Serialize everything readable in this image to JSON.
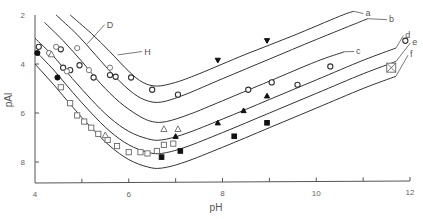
{
  "chart_data": {
    "type": "line",
    "title": "",
    "xlabel": "pH",
    "ylabel": "pAl",
    "xlim": [
      4,
      12
    ],
    "ylim": [
      2,
      8.85
    ],
    "y_inverted": true,
    "grid": false,
    "x_ticks": [
      4,
      5,
      6,
      7,
      8,
      9,
      10,
      11,
      12
    ],
    "x_tick_labels": [
      "4",
      "",
      "6",
      "",
      "8",
      "",
      "10",
      "",
      "12"
    ],
    "y_ticks": [
      2,
      4,
      6,
      8
    ],
    "y_tick_labels": [
      "2",
      "4",
      "6",
      "8"
    ],
    "series": [
      {
        "name": "a",
        "type": "curve",
        "points": [
          [
            4.75,
            2.0
          ],
          [
            5.2,
            2.75
          ],
          [
            5.6,
            3.5
          ],
          [
            6.0,
            4.3
          ],
          [
            6.3,
            4.75
          ],
          [
            6.6,
            4.9
          ],
          [
            7.0,
            4.75
          ],
          [
            7.5,
            4.4
          ],
          [
            8.5,
            3.6
          ],
          [
            9.5,
            2.85
          ],
          [
            10.5,
            2.05
          ],
          [
            10.8,
            1.85
          ]
        ]
      },
      {
        "name": "b",
        "type": "curve",
        "points": [
          [
            4.45,
            2.0
          ],
          [
            4.9,
            2.8
          ],
          [
            5.3,
            3.65
          ],
          [
            5.7,
            4.5
          ],
          [
            6.1,
            5.2
          ],
          [
            6.4,
            5.5
          ],
          [
            6.7,
            5.55
          ],
          [
            7.2,
            5.25
          ],
          [
            8.0,
            4.6
          ],
          [
            9.0,
            3.8
          ],
          [
            10.0,
            3.0
          ],
          [
            11.1,
            2.15
          ]
        ]
      },
      {
        "name": "c",
        "type": "curve",
        "points": [
          [
            4.2,
            2.3
          ],
          [
            4.6,
            3.05
          ],
          [
            5.0,
            3.9
          ],
          [
            5.4,
            4.8
          ],
          [
            5.8,
            5.55
          ],
          [
            6.2,
            6.1
          ],
          [
            6.5,
            6.35
          ],
          [
            6.8,
            6.35
          ],
          [
            7.3,
            6.05
          ],
          [
            8.0,
            5.5
          ],
          [
            9.0,
            4.7
          ],
          [
            10.0,
            3.9
          ],
          [
            10.6,
            3.5
          ]
        ]
      },
      {
        "name": "d",
        "type": "curve",
        "points": [
          [
            4.0,
            2.95
          ],
          [
            4.4,
            3.7
          ],
          [
            4.8,
            4.6
          ],
          [
            5.2,
            5.45
          ],
          [
            5.6,
            6.2
          ],
          [
            6.0,
            6.75
          ],
          [
            6.4,
            7.05
          ],
          [
            6.7,
            7.1
          ],
          [
            7.2,
            6.85
          ],
          [
            8.0,
            6.25
          ],
          [
            9.0,
            5.45
          ],
          [
            10.0,
            4.65
          ],
          [
            11.0,
            3.85
          ],
          [
            11.7,
            3.35
          ]
        ]
      },
      {
        "name": "e",
        "type": "curve",
        "points": [
          [
            4.0,
            3.45
          ],
          [
            4.4,
            4.25
          ],
          [
            4.8,
            5.15
          ],
          [
            5.2,
            6.0
          ],
          [
            5.6,
            6.75
          ],
          [
            6.0,
            7.3
          ],
          [
            6.4,
            7.6
          ],
          [
            6.7,
            7.65
          ],
          [
            7.2,
            7.4
          ],
          [
            8.0,
            6.8
          ],
          [
            9.0,
            6.0
          ],
          [
            10.0,
            5.2
          ],
          [
            11.0,
            4.4
          ],
          [
            11.7,
            3.9
          ]
        ]
      },
      {
        "name": "f",
        "type": "curve",
        "points": [
          [
            4.0,
            4.0
          ],
          [
            4.4,
            4.85
          ],
          [
            4.8,
            5.75
          ],
          [
            5.2,
            6.6
          ],
          [
            5.6,
            7.35
          ],
          [
            6.0,
            7.9
          ],
          [
            6.4,
            8.2
          ],
          [
            6.7,
            8.25
          ],
          [
            7.2,
            8.0
          ],
          [
            8.0,
            7.4
          ],
          [
            9.0,
            6.6
          ],
          [
            10.0,
            5.8
          ],
          [
            11.0,
            5.0
          ],
          [
            11.7,
            4.5
          ]
        ]
      }
    ],
    "curve_labels": [
      {
        "name": "a",
        "at": [
          11.05,
          1.9
        ]
      },
      {
        "name": "b",
        "at": [
          11.55,
          2.15
        ]
      },
      {
        "name": "c",
        "at": [
          10.85,
          3.45
        ]
      },
      {
        "name": "d",
        "at": [
          11.9,
          2.8
        ]
      },
      {
        "name": "e",
        "at": [
          12.05,
          3.1
        ]
      },
      {
        "name": "f",
        "at": [
          12.0,
          3.6
        ]
      }
    ],
    "markers": [
      {
        "shape": "circle-open",
        "points": [
          [
            4.08,
            3.3
          ],
          [
            4.55,
            3.4
          ],
          [
            4.6,
            4.15
          ],
          [
            4.75,
            4.25
          ],
          [
            4.95,
            4.05
          ],
          [
            5.25,
            4.55
          ],
          [
            5.6,
            4.45
          ],
          [
            5.72,
            4.52
          ],
          [
            6.05,
            4.55
          ],
          [
            6.5,
            5.05
          ],
          [
            7.05,
            5.25
          ],
          [
            8.55,
            5.05
          ],
          [
            9.05,
            4.75
          ],
          [
            9.6,
            4.85
          ],
          [
            10.3,
            4.1
          ],
          [
            11.9,
            3.05
          ]
        ]
      },
      {
        "shape": "circle-open-light",
        "points": [
          [
            4.3,
            3.55
          ],
          [
            4.45,
            3.3
          ],
          [
            4.68,
            4.3
          ],
          [
            4.9,
            3.35
          ],
          [
            5.15,
            4.25
          ],
          [
            5.6,
            4.15
          ]
        ]
      },
      {
        "shape": "circle-filled",
        "points": [
          [
            4.05,
            3.55
          ],
          [
            4.48,
            4.55
          ]
        ]
      },
      {
        "shape": "square-open",
        "points": [
          [
            4.55,
            4.95
          ],
          [
            4.75,
            5.6
          ],
          [
            4.9,
            6.1
          ],
          [
            5.05,
            6.35
          ],
          [
            5.2,
            6.6
          ],
          [
            5.35,
            6.85
          ],
          [
            5.55,
            7.1
          ],
          [
            5.75,
            7.35
          ],
          [
            6.0,
            7.6
          ],
          [
            6.25,
            7.6
          ],
          [
            6.4,
            7.65
          ],
          [
            6.6,
            7.55
          ],
          [
            6.75,
            7.3
          ],
          [
            6.95,
            7.25
          ]
        ]
      },
      {
        "shape": "triangle-open",
        "points": [
          [
            4.35,
            3.6
          ],
          [
            5.5,
            6.9
          ],
          [
            6.75,
            6.65
          ],
          [
            7.05,
            6.65
          ]
        ]
      },
      {
        "shape": "triangle-filled",
        "points": [
          [
            7.0,
            6.95
          ],
          [
            7.9,
            6.4
          ],
          [
            8.45,
            5.9
          ],
          [
            8.95,
            5.3
          ]
        ]
      },
      {
        "shape": "triangle-down-filled",
        "points": [
          [
            7.9,
            3.85
          ],
          [
            8.95,
            3.05
          ]
        ]
      },
      {
        "shape": "square-filled",
        "points": [
          [
            6.7,
            7.8
          ],
          [
            7.1,
            7.55
          ],
          [
            8.25,
            6.95
          ],
          [
            8.95,
            6.4
          ]
        ]
      },
      {
        "shape": "square-crossed",
        "points": [
          [
            11.6,
            4.15
          ]
        ]
      }
    ],
    "annotations": [
      {
        "text": "D",
        "point": [
          5.05,
          3.3
        ],
        "label_at": [
          5.55,
          2.35
        ]
      },
      {
        "text": "H",
        "point": [
          5.7,
          3.75
        ],
        "label_at": [
          6.35,
          3.45
        ]
      }
    ]
  }
}
